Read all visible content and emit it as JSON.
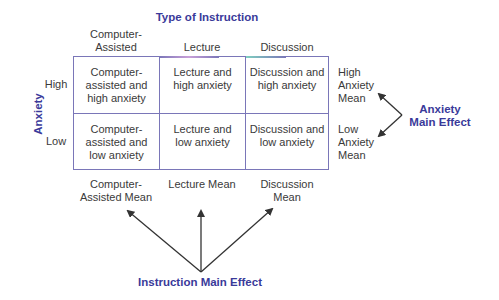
{
  "title": "Type of Instruction",
  "row_axis_label": "Anxiety",
  "columns": [
    "Computer-\nAssisted",
    "Lecture",
    "Discussion"
  ],
  "rows": [
    "High",
    "Low"
  ],
  "cells": [
    [
      "Computer-\nassisted and\nhigh anxiety",
      "Lecture and\nhigh anxiety",
      "Discussion and\nhigh anxiety"
    ],
    [
      "Computer-\nassisted and\nlow anxiety",
      "Lecture and\nlow anxiety",
      "Discussion and\nlow anxiety"
    ]
  ],
  "row_means": [
    "High\nAnxiety\nMean",
    "Low\nAnxiety\nMean"
  ],
  "column_means": [
    "Computer-\nAssisted Mean",
    "Lecture Mean",
    "Discussion\nMean"
  ],
  "anxiety_effect_label": "Anxiety\nMain Effect",
  "instruction_effect_label": "Instruction Main Effect",
  "colors": {
    "accent": "#3a3a9a",
    "grid": "#7a76b8",
    "text": "#3a3a3a",
    "arrow": "#333333"
  }
}
